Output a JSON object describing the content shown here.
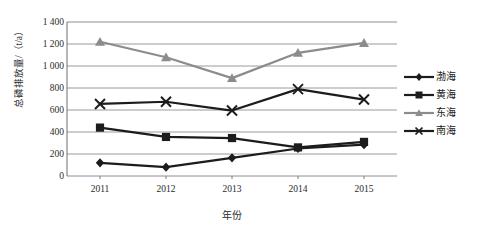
{
  "chart_data": {
    "type": "line",
    "title": "",
    "xlabel": "年份",
    "ylabel": "总磷排放量/（t/a）",
    "categories": [
      "2011",
      "2012",
      "2013",
      "2014",
      "2015"
    ],
    "x": [
      2011,
      2012,
      2013,
      2014,
      2015
    ],
    "ylim": [
      0,
      1400
    ],
    "ytick_labels": [
      "0",
      "200",
      "400",
      "600",
      "800",
      "1 000",
      "1 200",
      "1 400"
    ],
    "ytick_values": [
      0,
      200,
      400,
      600,
      800,
      1000,
      1200,
      1400
    ],
    "grid": true,
    "grid_axis": "y",
    "legend_position": "right",
    "series": [
      {
        "name": "渤海",
        "marker": "diamond",
        "color": "#1c1c1c",
        "values": [
          120,
          80,
          165,
          250,
          285
        ]
      },
      {
        "name": "黄海",
        "marker": "square",
        "color": "#1c1c1c",
        "values": [
          440,
          355,
          345,
          260,
          310
        ]
      },
      {
        "name": "东海",
        "marker": "triangle",
        "color": "#8c8c8c",
        "values": [
          1220,
          1080,
          890,
          1120,
          1210
        ]
      },
      {
        "name": "南海",
        "marker": "cross",
        "color": "#1c1c1c",
        "values": [
          655,
          675,
          595,
          790,
          695
        ]
      }
    ]
  },
  "legend": {
    "items": [
      {
        "label": "渤海"
      },
      {
        "label": "黄海"
      },
      {
        "label": "东海"
      },
      {
        "label": "南海"
      }
    ]
  }
}
